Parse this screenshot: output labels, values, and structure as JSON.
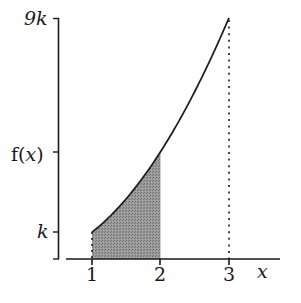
{
  "chart_data": {
    "type": "area",
    "title": "",
    "function": "f(x) = k x^2",
    "xlabel": "x",
    "ylabel": "f(x)",
    "x_ticks": [
      "1",
      "2",
      "3"
    ],
    "y_ticks": [
      "k",
      "f(x)",
      "9k"
    ],
    "x": [
      1,
      1.25,
      1.5,
      1.75,
      2,
      2.25,
      2.5,
      2.75,
      3
    ],
    "y_in_units_of_k": [
      1,
      1.5625,
      2.25,
      3.0625,
      4,
      5.0625,
      6.25,
      7.5625,
      9
    ],
    "shaded_region": {
      "x_from": 1,
      "x_to": 2,
      "description": "area under curve between x=1 and x=2"
    },
    "dotted_lines": [
      {
        "x": 1,
        "from": 0,
        "to": 1
      },
      {
        "x": 3,
        "from": 0,
        "to": 9
      }
    ],
    "ylim": [
      0,
      9
    ],
    "xlim": [
      0.6,
      3.7
    ],
    "grid": false,
    "legend": "none"
  },
  "labels": {
    "y_top": "9k",
    "y_fx": "f(x)",
    "y_k": "k",
    "x1": "1",
    "x2": "2",
    "x3": "3",
    "x_axis": "x"
  },
  "colors": {
    "line": "#1a1a1a",
    "shade": "#8a8a8a",
    "background": "#ffffff"
  }
}
